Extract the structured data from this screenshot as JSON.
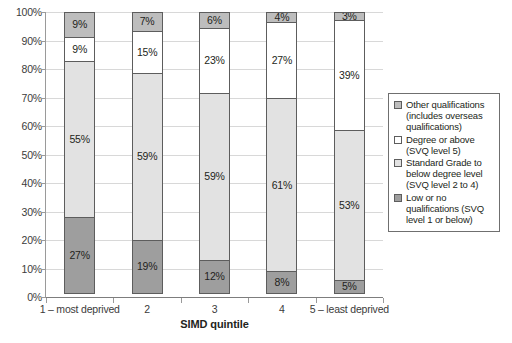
{
  "chart_data": {
    "type": "bar",
    "title": "",
    "subtitle": "",
    "xlabel": "SIMD quintile",
    "ylabel": "",
    "ylim": [
      0,
      100
    ],
    "grid": true,
    "stacked": true,
    "stack_total": 100,
    "legend_position": "right",
    "categories": [
      "1 – most deprived",
      "2",
      "3",
      "4",
      "5 – least deprived"
    ],
    "ytick_labels": [
      "0%",
      "10%",
      "20%",
      "30%",
      "40%",
      "50%",
      "60%",
      "70%",
      "80%",
      "90%",
      "100%"
    ],
    "ytick_values": [
      0,
      10,
      20,
      30,
      40,
      50,
      60,
      70,
      80,
      90,
      100
    ],
    "series": [
      {
        "name": "Low or no qualifications (SVQ level 1 or below)",
        "color": "#9e9e9e",
        "values": [
          27,
          19,
          12,
          8,
          5
        ],
        "labels": [
          "27%",
          "19%",
          "12%",
          "8%",
          "5%"
        ]
      },
      {
        "name": "Standard Grade to below degree level (SVQ level 2 to 4)",
        "color": "#e2e2e2",
        "values": [
          55,
          59,
          59,
          61,
          53
        ],
        "labels": [
          "55%",
          "59%",
          "59%",
          "61%",
          "53%"
        ]
      },
      {
        "name": "Degree or above (SVQ level 5)",
        "color": "#ffffff",
        "values": [
          9,
          15,
          23,
          27,
          39
        ],
        "labels": [
          "9%",
          "15%",
          "23%",
          "27%",
          "39%"
        ]
      },
      {
        "name": "Other qualifications (includes overseas qualifications)",
        "color": "#bdbdbd",
        "values": [
          9,
          7,
          6,
          4,
          3
        ],
        "labels": [
          "9%",
          "7%",
          "6%",
          "4%",
          "3%"
        ]
      }
    ]
  },
  "legend": {
    "items": [
      {
        "swatch_color": "#bdbdbd",
        "label": "Other qualifications (includes overseas qualifications)"
      },
      {
        "swatch_color": "#ffffff",
        "label": "Degree or above (SVQ level 5)"
      },
      {
        "swatch_color": "#e2e2e2",
        "label": "Standard Grade to below degree level (SVQ level 2 to 4)"
      },
      {
        "swatch_color": "#9e9e9e",
        "label": "Low or no qualifications (SVQ level 1 or below)"
      }
    ]
  },
  "colors": {
    "axis": "#9a9a9a",
    "gridline": "#d8d8d8",
    "segment_border": "#5d5d5d",
    "text": "#231f20",
    "background": "#ffffff"
  }
}
